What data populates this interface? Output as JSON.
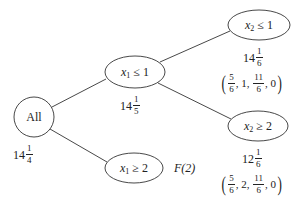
{
  "nodes": {
    "root": {
      "label": "All",
      "value_whole": "14",
      "value_num": "1",
      "value_den": "4"
    },
    "x1_le_1": {
      "var": "x",
      "sub": "1",
      "op": "≤",
      "rhs": "1",
      "value_whole": "14",
      "value_num": "1",
      "value_den": "5"
    },
    "x1_ge_2": {
      "var": "x",
      "sub": "1",
      "op": "≥",
      "rhs": "2",
      "status": "F(2)"
    },
    "x2_le_1": {
      "var": "x",
      "sub": "2",
      "op": "≤",
      "rhs": "1",
      "value_whole": "14",
      "value_num": "1",
      "value_den": "6",
      "solution": {
        "a_num": "5",
        "a_den": "6",
        "b": "1",
        "c_num": "11",
        "c_den": "6",
        "d": "0"
      }
    },
    "x2_ge_2": {
      "var": "x",
      "sub": "2",
      "op": "≥",
      "rhs": "2",
      "value_whole": "12",
      "value_num": "1",
      "value_den": "6",
      "solution": {
        "a_num": "5",
        "a_den": "6",
        "b": "2",
        "c_num": "11",
        "c_den": "6",
        "d": "0"
      }
    }
  },
  "punct": {
    "lp": "(",
    "rp": ")",
    "comma": ","
  },
  "colors": {
    "stroke": "#333333",
    "text": "#222222"
  }
}
